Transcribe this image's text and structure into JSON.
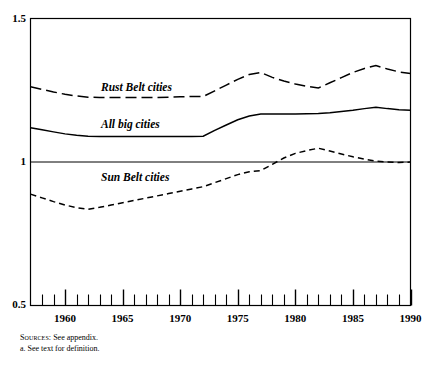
{
  "figure": {
    "footnotes": [
      {
        "prefix": "Sources:",
        "text": " See appendix."
      },
      {
        "prefix": "",
        "text": "a. See text for definition."
      }
    ]
  },
  "chart_data": {
    "type": "line",
    "title": "",
    "xlabel": "",
    "ylabel": "",
    "xlim": [
      1957,
      1990
    ],
    "ylim": [
      0.5,
      1.5
    ],
    "grid": false,
    "legend_position": "inline-annotation",
    "y_ticks": [
      "0.5",
      "1",
      "1.5"
    ],
    "y_tick_values": [
      0.5,
      1.0,
      1.5
    ],
    "x_ticks": [
      "1960",
      "1965",
      "1970",
      "1975",
      "1980",
      "1985",
      "1990"
    ],
    "x_tick_values": [
      1960,
      1965,
      1970,
      1975,
      1980,
      1985,
      1990
    ],
    "x_minor_tick_step": 1,
    "reference_line_y": 1.0,
    "x": [
      1957,
      1958,
      1959,
      1960,
      1961,
      1962,
      1963,
      1964,
      1965,
      1966,
      1967,
      1968,
      1969,
      1970,
      1971,
      1972,
      1973,
      1974,
      1975,
      1976,
      1977,
      1978,
      1979,
      1980,
      1981,
      1982,
      1983,
      1984,
      1985,
      1986,
      1987,
      1988,
      1989,
      1990
    ],
    "series": [
      {
        "name": "Rust Belt cities",
        "style": "long-dash",
        "color": "#000000",
        "values": [
          1.262,
          1.253,
          1.244,
          1.236,
          1.23,
          1.226,
          1.225,
          1.225,
          1.225,
          1.225,
          1.225,
          1.225,
          1.226,
          1.227,
          1.228,
          1.228,
          1.248,
          1.268,
          1.288,
          1.305,
          1.312,
          1.295,
          1.282,
          1.272,
          1.264,
          1.258,
          1.276,
          1.294,
          1.312,
          1.326,
          1.336,
          1.324,
          1.314,
          1.308
        ]
      },
      {
        "name": "All big cities",
        "style": "solid",
        "color": "#000000",
        "values": [
          1.119,
          1.112,
          1.105,
          1.098,
          1.093,
          1.09,
          1.089,
          1.089,
          1.089,
          1.089,
          1.089,
          1.089,
          1.089,
          1.089,
          1.089,
          1.09,
          1.11,
          1.129,
          1.147,
          1.16,
          1.167,
          1.167,
          1.167,
          1.167,
          1.168,
          1.169,
          1.172,
          1.176,
          1.18,
          1.186,
          1.191,
          1.186,
          1.182,
          1.18
        ]
      },
      {
        "name": "Sun Belt cities",
        "style": "short-dash",
        "color": "#000000",
        "values": [
          0.888,
          0.875,
          0.862,
          0.85,
          0.841,
          0.835,
          0.842,
          0.85,
          0.858,
          0.866,
          0.874,
          0.882,
          0.89,
          0.898,
          0.906,
          0.914,
          0.928,
          0.942,
          0.956,
          0.966,
          0.97,
          0.992,
          1.014,
          1.03,
          1.04,
          1.048,
          1.038,
          1.028,
          1.018,
          1.01,
          1.003,
          1.0,
          0.998,
          1.0
        ]
      }
    ]
  }
}
